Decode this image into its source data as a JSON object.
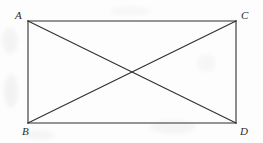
{
  "figure": {
    "kind": "geometry-diagram",
    "canvas": {
      "width": 263,
      "height": 143
    },
    "background_color": "#fdfdfd",
    "stroke_color": "#2f2f2f",
    "stroke_width": 1.1,
    "rectangle": {
      "left": 28,
      "top": 21,
      "right": 236,
      "bottom": 123,
      "width": 208,
      "height": 102
    },
    "vertices": [
      {
        "id": "A",
        "label": "A",
        "x": 28,
        "y": 21,
        "position": "top-left"
      },
      {
        "id": "C",
        "label": "C",
        "x": 236,
        "y": 21,
        "position": "top-right"
      },
      {
        "id": "B",
        "label": "B",
        "x": 28,
        "y": 123,
        "position": "bottom-left"
      },
      {
        "id": "D",
        "label": "D",
        "x": 236,
        "y": 123,
        "position": "bottom-right"
      }
    ],
    "edges": [
      {
        "id": "AC",
        "from": "A",
        "to": "C",
        "role": "top-side"
      },
      {
        "id": "CD",
        "from": "C",
        "to": "D",
        "role": "right-side"
      },
      {
        "id": "DB",
        "from": "D",
        "to": "B",
        "role": "bottom-side"
      },
      {
        "id": "BA",
        "from": "B",
        "to": "A",
        "role": "left-side"
      }
    ],
    "diagonals": [
      {
        "id": "AD",
        "from": "A",
        "to": "D"
      },
      {
        "id": "CB",
        "from": "C",
        "to": "B"
      }
    ],
    "intersection": {
      "x": 132,
      "y": 72
    }
  }
}
